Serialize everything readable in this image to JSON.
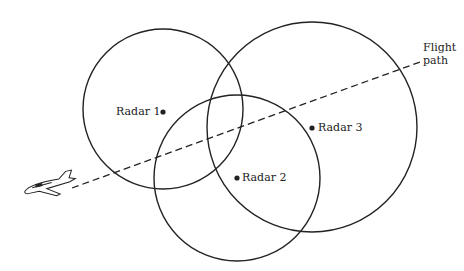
{
  "diagram": {
    "radars": [
      {
        "label": "Radar 1",
        "cx": 163,
        "cy": 109,
        "r": 80
      },
      {
        "label": "Radar 2",
        "cx": 237,
        "cy": 178,
        "r": 83
      },
      {
        "label": "Radar 3",
        "cx": 312,
        "cy": 127,
        "r": 105
      }
    ],
    "flight_path_label_line1": "Flight",
    "flight_path_label_line2": "path",
    "colors": {
      "stroke": "#222222",
      "background": "#ffffff"
    }
  }
}
